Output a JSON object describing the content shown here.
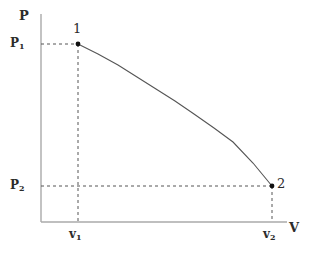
{
  "figure": {
    "title": "",
    "background_color": "#ffffff",
    "axis_color": "#aaaaaa",
    "guide_color": "#555555",
    "curve_color": "#555555",
    "marker_color": "#111111",
    "text_color": "#2b2b2b"
  },
  "axes": {
    "y_label": "P",
    "x_label": "V",
    "origin_px": [
      41,
      222
    ],
    "y_top_px": 14,
    "x_right_px": 287
  },
  "ticks": {
    "y": [
      {
        "text": "P",
        "sub": "1",
        "value_px": 44
      },
      {
        "text": "P",
        "sub": "2",
        "value_px": 186
      }
    ],
    "x": [
      {
        "text": "v",
        "sub": "1",
        "value_px": 78
      },
      {
        "text": "v",
        "sub": "2",
        "value_px": 272
      }
    ]
  },
  "points": [
    {
      "label": "1",
      "x_px": 78,
      "y_px": 44
    },
    {
      "label": "2",
      "x_px": 272,
      "y_px": 186
    }
  ],
  "chart_data": {
    "type": "line",
    "title": "",
    "xlabel": "V",
    "ylabel": "P",
    "grid": false,
    "legend": null,
    "xlim": [
      41,
      287
    ],
    "ylim": [
      222,
      14
    ],
    "xtick_labels": [
      "v₁",
      "v₂"
    ],
    "ytick_labels": [
      "P₂",
      "P₁"
    ],
    "annotations": [
      "1",
      "2"
    ],
    "series": [
      {
        "name": "process 1 to 2",
        "x": [
          78,
          98,
          118,
          137,
          156,
          175,
          194,
          214,
          233,
          253,
          272
        ],
        "y": [
          44,
          54,
          65,
          77,
          89,
          101,
          114,
          128,
          142,
          163,
          186
        ]
      }
    ],
    "guides": [
      {
        "name": "P1-horizontal",
        "from": [
          41,
          44
        ],
        "to": [
          78,
          44
        ],
        "style": "dashed"
      },
      {
        "name": "v1-vertical",
        "from": [
          78,
          44
        ],
        "to": [
          78,
          222
        ],
        "style": "dashed"
      },
      {
        "name": "P2-horizontal",
        "from": [
          41,
          186
        ],
        "to": [
          272,
          186
        ],
        "style": "dashed"
      },
      {
        "name": "v2-vertical",
        "from": [
          272,
          186
        ],
        "to": [
          272,
          222
        ],
        "style": "dashed"
      }
    ]
  }
}
